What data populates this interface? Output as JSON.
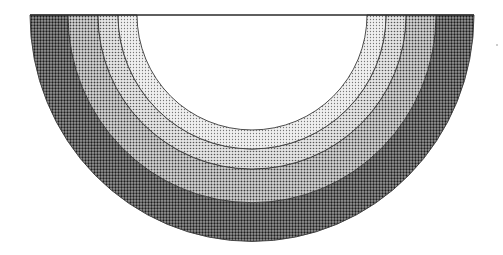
{
  "diagram": {
    "type": "concentric-half-rings",
    "center": {
      "x": 252,
      "y": 15
    },
    "vertical_scale": 1.0,
    "top_line": {
      "x1": 30,
      "x2": 474,
      "y": 15
    },
    "bands": [
      {
        "name": "outer-band",
        "r_outer": 222,
        "r_inner": 184,
        "color": "#4a4a4a",
        "dot": "#1c1c1c",
        "bg": "#9a9a9a"
      },
      {
        "name": "band-3",
        "r_outer": 184,
        "r_inner": 154,
        "color": "#8c8c8c",
        "dot": "#3a3a3a",
        "bg": "#d6d6d6"
      },
      {
        "name": "band-2",
        "r_outer": 154,
        "r_inner": 134,
        "color": "#a8a8a8",
        "dot": "#555555",
        "bg": "#e4e4e4"
      },
      {
        "name": "inner-band",
        "r_outer": 134,
        "r_inner": 115,
        "color": "#c8c8c8",
        "dot": "#777777",
        "bg": "#f0f0f0"
      }
    ],
    "center_fill": "#ffffff"
  }
}
